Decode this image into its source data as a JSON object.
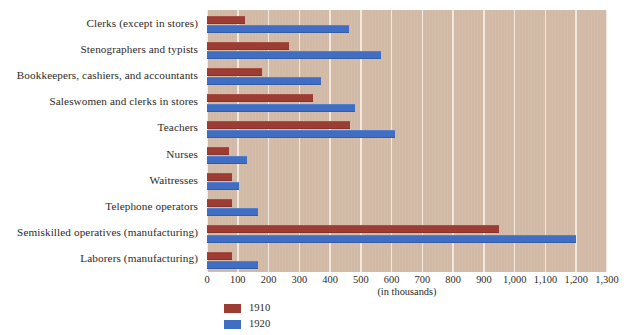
{
  "chart_data": {
    "type": "bar",
    "orientation": "horizontal",
    "title": "",
    "subtitle": "",
    "xlabel": "(in thousands)",
    "ylabel": "",
    "xlim": [
      0,
      1300
    ],
    "xticks": [
      0,
      100,
      200,
      300,
      400,
      500,
      600,
      700,
      800,
      900,
      1000,
      1100,
      1200,
      1300
    ],
    "xtick_labels": [
      "0",
      "100",
      "200",
      "300",
      "400",
      "500",
      "600",
      "700",
      "800",
      "900",
      "1,000",
      "1,100",
      "1,200",
      "1,300"
    ],
    "grid": true,
    "grid_axis": "x",
    "legend_position": "bottom-left",
    "categories": [
      "Clerks (except in stores)",
      "Stenographers and typists",
      "Bookkeepers, cashiers, and accountants",
      "Saleswomen and clerks in stores",
      "Teachers",
      "Nurses",
      "Waitresses",
      "Telephone operators",
      "Semiskilled operatives (manufacturing)",
      "Laborers (manufacturing)"
    ],
    "series": [
      {
        "name": "1910",
        "color": "#9d3c33",
        "values": [
          125,
          265,
          180,
          345,
          465,
          70,
          80,
          80,
          950,
          80
        ]
      },
      {
        "name": "1920",
        "color": "#3f6ec4",
        "values": [
          460,
          565,
          370,
          480,
          610,
          130,
          105,
          165,
          1200,
          165
        ]
      }
    ]
  },
  "legend": {
    "items": [
      {
        "label": "1910",
        "color": "#9d3c33"
      },
      {
        "label": "1920",
        "color": "#3f6ec4"
      }
    ]
  },
  "style": {
    "plot_background": "#d3bba6",
    "gridline_color": "#f3ece4",
    "text_color": "#2e2a26"
  }
}
